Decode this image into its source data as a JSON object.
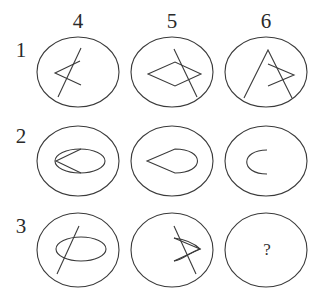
{
  "puzzle": {
    "column_labels": [
      "4",
      "5",
      "6"
    ],
    "row_labels": [
      "1",
      "2",
      "3"
    ],
    "stroke_color": "#3a3a3a",
    "cells": [
      {
        "row": "1",
        "col": "4",
        "content": "open angle (arrowhead pointing left) crossed by a slanted line"
      },
      {
        "row": "1",
        "col": "5",
        "content": "rhombus crossed by a slanted line"
      },
      {
        "row": "1",
        "col": "6",
        "content": "inverted V with a small open angle pointing right crossed by its right stroke"
      },
      {
        "row": "2",
        "col": "4",
        "content": "ellipse with a pointed arrowhead on its left side"
      },
      {
        "row": "2",
        "col": "5",
        "content": "teardrop shape pointing left"
      },
      {
        "row": "2",
        "col": "6",
        "content": "open C-shaped arc"
      },
      {
        "row": "3",
        "col": "4",
        "content": "ellipse crossed by a slanted line"
      },
      {
        "row": "3",
        "col": "5",
        "content": "crescent/lens shape pointing right crossed by a slanted line"
      },
      {
        "row": "3",
        "col": "6",
        "content": "?"
      }
    ],
    "question_mark": "?"
  }
}
